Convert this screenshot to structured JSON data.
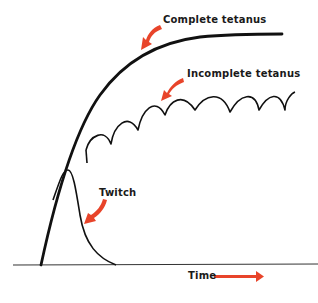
{
  "diagram": {
    "title": "",
    "labels": {
      "complete_tetanus": "Complete tetanus",
      "incomplete_tetanus": "Incomplete tetanus",
      "twitch": "Twitch",
      "time": "Time"
    },
    "colors": {
      "curve": "#111111",
      "arrow": "#e8442a",
      "baseline": "#333333",
      "background": "#ffffff"
    },
    "curves": [
      {
        "name": "Complete tetanus",
        "description": "smooth rise to plateau"
      },
      {
        "name": "Incomplete tetanus",
        "description": "scalloped rising summation of twitches"
      },
      {
        "name": "Twitch",
        "description": "single rise and fall"
      }
    ],
    "axis": {
      "x_label": "Time",
      "x_direction": "right"
    }
  }
}
